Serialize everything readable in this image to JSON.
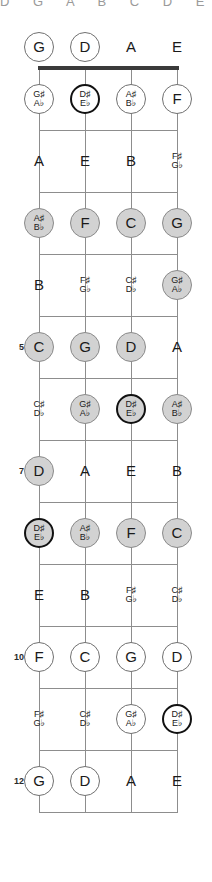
{
  "title_fragment": "D  G  A  B  C  D  E",
  "instrument": "bass-guitar-fretboard",
  "colors": {
    "line": "#8d8d8d",
    "nut": "#3a3a3a",
    "filled": "#d2d2d2",
    "open": "#ffffff",
    "root_ring": "#111111",
    "text": "#1a1a1a"
  },
  "geometry": {
    "string_x": [
      39,
      85,
      131,
      177
    ],
    "nut_y": 68,
    "fret_spacing": 62,
    "open_label_y": 47
  },
  "strings": [
    {
      "name": "G-string",
      "open_note": "G"
    },
    {
      "name": "D-string",
      "open_note": "D"
    },
    {
      "name": "A-string",
      "open_note": "A"
    },
    {
      "name": "E-string",
      "open_note": "E"
    }
  ],
  "fret_numbers": [
    {
      "fret": 5,
      "label": "5"
    },
    {
      "fret": 7,
      "label": "7"
    },
    {
      "fret": 10,
      "label": "10"
    },
    {
      "fret": 12,
      "label": "12"
    }
  ],
  "legend": {
    "plain": "note not in scale - plain text, no circle",
    "open": "note in scale - white circle",
    "filled": "note in scale - gray filled circle",
    "root": "root note - thick dark ring"
  },
  "frets": [
    {
      "fret": 0,
      "notes": [
        {
          "string": 0,
          "label": "G",
          "sharp": "",
          "flat": "",
          "style": "open"
        },
        {
          "string": 1,
          "label": "D",
          "sharp": "",
          "flat": "",
          "style": "open"
        },
        {
          "string": 2,
          "label": "A",
          "sharp": "",
          "flat": "",
          "style": "plain"
        },
        {
          "string": 3,
          "label": "E",
          "sharp": "",
          "flat": "",
          "style": "plain"
        }
      ]
    },
    {
      "fret": 1,
      "notes": [
        {
          "string": 0,
          "label": "",
          "sharp": "G♯",
          "flat": "A♭",
          "style": "open"
        },
        {
          "string": 1,
          "label": "",
          "sharp": "D♯",
          "flat": "E♭",
          "style": "root-open"
        },
        {
          "string": 2,
          "label": "",
          "sharp": "A♯",
          "flat": "B♭",
          "style": "open"
        },
        {
          "string": 3,
          "label": "F",
          "sharp": "",
          "flat": "",
          "style": "open"
        }
      ]
    },
    {
      "fret": 2,
      "notes": [
        {
          "string": 0,
          "label": "A",
          "sharp": "",
          "flat": "",
          "style": "plain"
        },
        {
          "string": 1,
          "label": "E",
          "sharp": "",
          "flat": "",
          "style": "plain"
        },
        {
          "string": 2,
          "label": "B",
          "sharp": "",
          "flat": "",
          "style": "plain"
        },
        {
          "string": 3,
          "label": "",
          "sharp": "F♯",
          "flat": "G♭",
          "style": "plain"
        }
      ]
    },
    {
      "fret": 3,
      "notes": [
        {
          "string": 0,
          "label": "",
          "sharp": "A♯",
          "flat": "B♭",
          "style": "filled"
        },
        {
          "string": 1,
          "label": "F",
          "sharp": "",
          "flat": "",
          "style": "filled"
        },
        {
          "string": 2,
          "label": "C",
          "sharp": "",
          "flat": "",
          "style": "filled"
        },
        {
          "string": 3,
          "label": "G",
          "sharp": "",
          "flat": "",
          "style": "filled"
        }
      ]
    },
    {
      "fret": 4,
      "notes": [
        {
          "string": 0,
          "label": "B",
          "sharp": "",
          "flat": "",
          "style": "plain"
        },
        {
          "string": 1,
          "label": "",
          "sharp": "F♯",
          "flat": "G♭",
          "style": "plain"
        },
        {
          "string": 2,
          "label": "",
          "sharp": "C♯",
          "flat": "D♭",
          "style": "plain"
        },
        {
          "string": 3,
          "label": "",
          "sharp": "G♯",
          "flat": "A♭",
          "style": "filled"
        }
      ]
    },
    {
      "fret": 5,
      "notes": [
        {
          "string": 0,
          "label": "C",
          "sharp": "",
          "flat": "",
          "style": "filled"
        },
        {
          "string": 1,
          "label": "G",
          "sharp": "",
          "flat": "",
          "style": "filled"
        },
        {
          "string": 2,
          "label": "D",
          "sharp": "",
          "flat": "",
          "style": "filled"
        },
        {
          "string": 3,
          "label": "A",
          "sharp": "",
          "flat": "",
          "style": "plain"
        }
      ]
    },
    {
      "fret": 6,
      "notes": [
        {
          "string": 0,
          "label": "",
          "sharp": "C♯",
          "flat": "D♭",
          "style": "plain"
        },
        {
          "string": 1,
          "label": "",
          "sharp": "G♯",
          "flat": "A♭",
          "style": "filled"
        },
        {
          "string": 2,
          "label": "",
          "sharp": "D♯",
          "flat": "E♭",
          "style": "root-filled"
        },
        {
          "string": 3,
          "label": "",
          "sharp": "A♯",
          "flat": "B♭",
          "style": "filled"
        }
      ]
    },
    {
      "fret": 7,
      "notes": [
        {
          "string": 0,
          "label": "D",
          "sharp": "",
          "flat": "",
          "style": "filled"
        },
        {
          "string": 1,
          "label": "A",
          "sharp": "",
          "flat": "",
          "style": "plain"
        },
        {
          "string": 2,
          "label": "E",
          "sharp": "",
          "flat": "",
          "style": "plain"
        },
        {
          "string": 3,
          "label": "B",
          "sharp": "",
          "flat": "",
          "style": "plain"
        }
      ]
    },
    {
      "fret": 8,
      "notes": [
        {
          "string": 0,
          "label": "",
          "sharp": "D♯",
          "flat": "E♭",
          "style": "root-filled"
        },
        {
          "string": 1,
          "label": "",
          "sharp": "A♯",
          "flat": "B♭",
          "style": "filled"
        },
        {
          "string": 2,
          "label": "F",
          "sharp": "",
          "flat": "",
          "style": "filled"
        },
        {
          "string": 3,
          "label": "C",
          "sharp": "",
          "flat": "",
          "style": "filled"
        }
      ]
    },
    {
      "fret": 9,
      "notes": [
        {
          "string": 0,
          "label": "E",
          "sharp": "",
          "flat": "",
          "style": "plain"
        },
        {
          "string": 1,
          "label": "B",
          "sharp": "",
          "flat": "",
          "style": "plain"
        },
        {
          "string": 2,
          "label": "",
          "sharp": "F♯",
          "flat": "G♭",
          "style": "plain"
        },
        {
          "string": 3,
          "label": "",
          "sharp": "C♯",
          "flat": "D♭",
          "style": "plain"
        }
      ]
    },
    {
      "fret": 10,
      "notes": [
        {
          "string": 0,
          "label": "F",
          "sharp": "",
          "flat": "",
          "style": "open"
        },
        {
          "string": 1,
          "label": "C",
          "sharp": "",
          "flat": "",
          "style": "open"
        },
        {
          "string": 2,
          "label": "G",
          "sharp": "",
          "flat": "",
          "style": "open"
        },
        {
          "string": 3,
          "label": "D",
          "sharp": "",
          "flat": "",
          "style": "open"
        }
      ]
    },
    {
      "fret": 11,
      "notes": [
        {
          "string": 0,
          "label": "",
          "sharp": "F♯",
          "flat": "G♭",
          "style": "plain"
        },
        {
          "string": 1,
          "label": "",
          "sharp": "C♯",
          "flat": "D♭",
          "style": "plain"
        },
        {
          "string": 2,
          "label": "",
          "sharp": "G♯",
          "flat": "A♭",
          "style": "open"
        },
        {
          "string": 3,
          "label": "",
          "sharp": "D♯",
          "flat": "E♭",
          "style": "root-open"
        }
      ]
    },
    {
      "fret": 12,
      "notes": [
        {
          "string": 0,
          "label": "G",
          "sharp": "",
          "flat": "",
          "style": "open"
        },
        {
          "string": 1,
          "label": "D",
          "sharp": "",
          "flat": "",
          "style": "open"
        },
        {
          "string": 2,
          "label": "A",
          "sharp": "",
          "flat": "",
          "style": "plain"
        },
        {
          "string": 3,
          "label": "E",
          "sharp": "",
          "flat": "",
          "style": "plain"
        }
      ]
    }
  ]
}
